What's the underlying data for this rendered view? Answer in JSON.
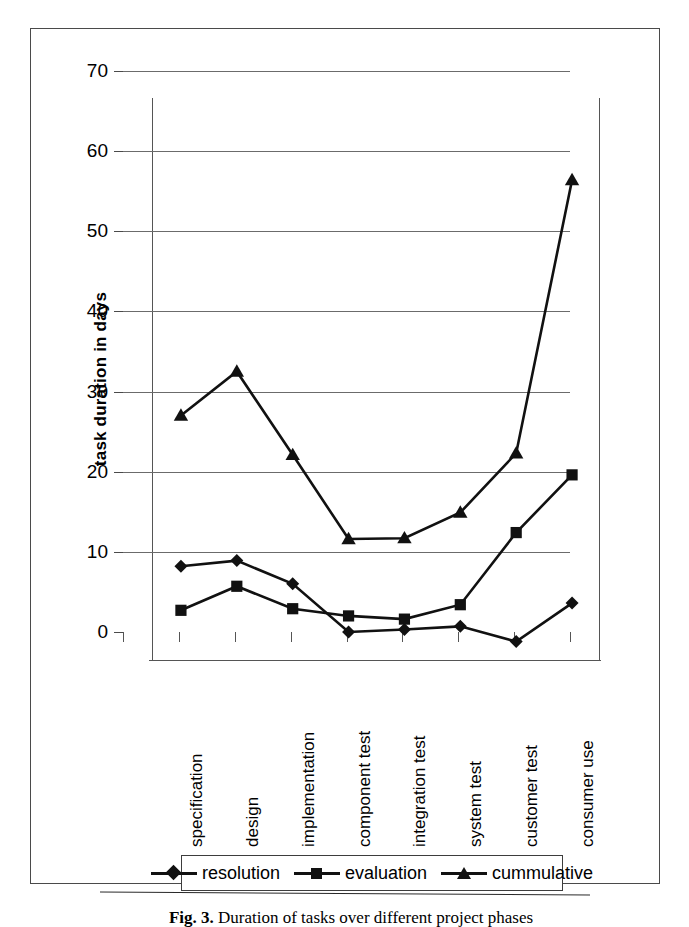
{
  "chart_data": {
    "type": "line",
    "title": "",
    "xlabel": "",
    "ylabel": "task duration in days",
    "ylim": [
      0,
      70
    ],
    "ytick_step": 10,
    "yticks": [
      "70",
      "60",
      "50",
      "40",
      "30",
      "20",
      "10",
      "0"
    ],
    "grid": true,
    "legend_position": "bottom",
    "categories": [
      "specification",
      "design",
      "implementation",
      "component test",
      "integration test",
      "system test",
      "customer test",
      "consumer use"
    ],
    "series": [
      {
        "name": "resolution",
        "marker": "diamond",
        "color": "#111111",
        "values": [
          11.7,
          12.4,
          9.5,
          3.5,
          3.8,
          4.2,
          2.3,
          7.1
        ]
      },
      {
        "name": "evaluation",
        "marker": "square",
        "color": "#111111",
        "values": [
          6.2,
          9.2,
          6.4,
          5.5,
          5.1,
          6.9,
          15.9,
          23.1
        ]
      },
      {
        "name": "cummulative",
        "marker": "triangle",
        "color": "#111111",
        "values": [
          30.5,
          36.0,
          25.6,
          15.1,
          15.2,
          18.4,
          25.8,
          59.9
        ]
      }
    ]
  },
  "legend": {
    "entries": [
      {
        "label": "resolution"
      },
      {
        "label": "evaluation"
      },
      {
        "label": "cummulative"
      }
    ]
  },
  "caption": {
    "figure_number": "Fig. 3.",
    "text": "Duration of tasks over different project phases"
  }
}
